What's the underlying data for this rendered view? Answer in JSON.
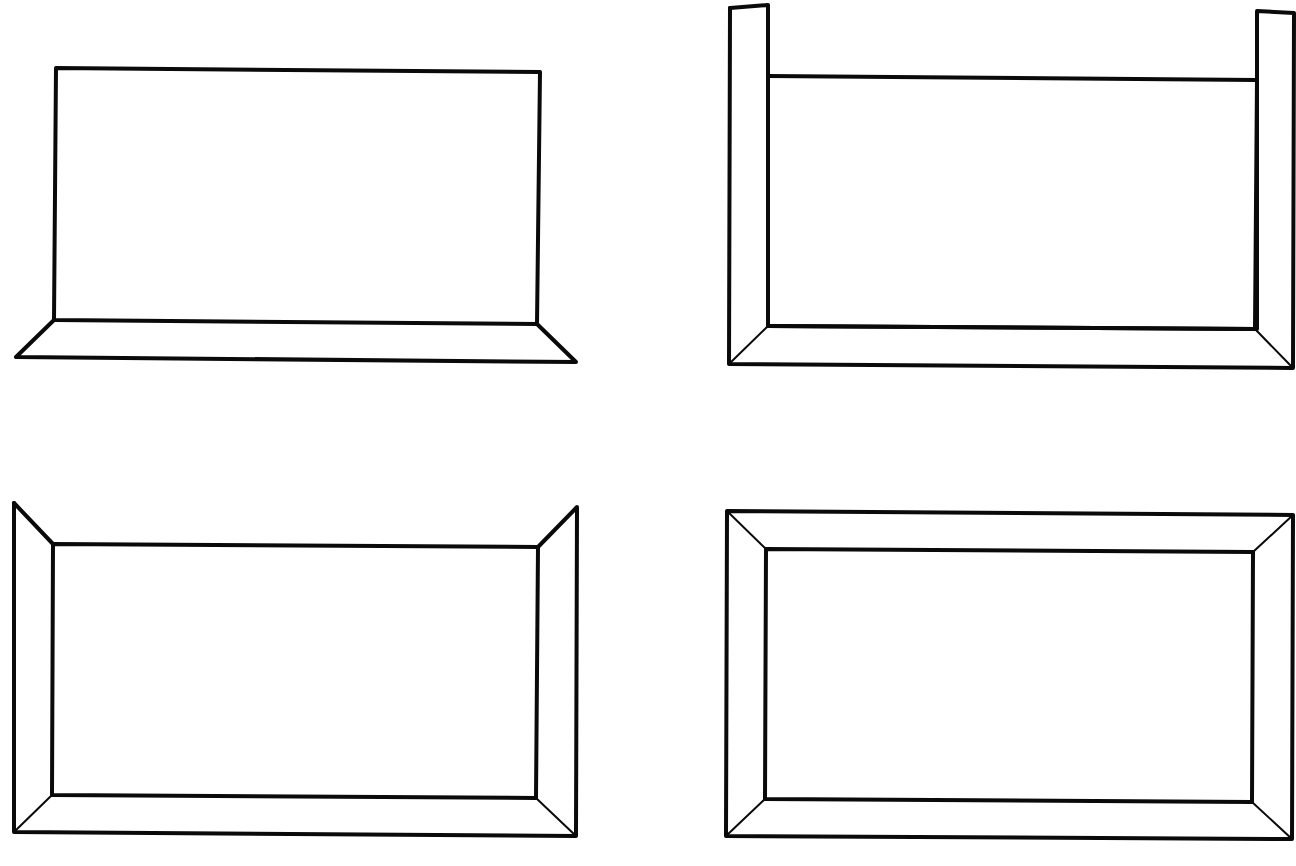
{
  "diagram": {
    "title": "",
    "stroke_color": "#0a0a0a",
    "background": "#ffffff",
    "panels": [
      {
        "id": "panel-1-bottom-trim",
        "description": "Rectangle with only the bottom molding strip flaring outward",
        "inner_rect": [
          [
            56,
            68
          ],
          [
            540,
            72
          ],
          [
            537,
            324
          ],
          [
            54,
            320
          ]
        ],
        "thick_paths": [
          [
            [
              56,
              68
            ],
            [
              540,
              72
            ],
            [
              537,
              324
            ],
            [
              54,
              320
            ],
            [
              56,
              68
            ]
          ],
          [
            [
              54,
              320
            ],
            [
              16,
              357
            ],
            [
              576,
              362
            ],
            [
              537,
              324
            ]
          ]
        ],
        "thin_paths": []
      },
      {
        "id": "panel-2-bottom-and-tall-sides",
        "description": "Rectangle with bottom molding and side strips extending above the top edge",
        "thick_paths": [
          [
            [
              768,
              76
            ],
            [
              1257,
              80
            ],
            [
              1255,
              329
            ],
            [
              768,
              326
            ]
          ],
          [
            [
              730,
              8
            ],
            [
              768,
              5
            ],
            [
              768,
              326
            ]
          ],
          [
            [
              730,
              8
            ],
            [
              729,
              364
            ],
            [
              1293,
              368
            ],
            [
              1294,
              13
            ],
            [
              1257,
              11
            ],
            [
              1257,
              329
            ]
          ],
          [
            [
              768,
              326
            ],
            [
              1255,
              329
            ]
          ]
        ],
        "thin_paths": [
          [
            [
              768,
              326
            ],
            [
              729,
              364
            ]
          ],
          [
            [
              1255,
              329
            ],
            [
              1293,
              368
            ]
          ]
        ]
      },
      {
        "id": "panel-3-sides-and-bottom",
        "description": "Rectangle with angled side strips and bottom molding, open top",
        "thick_paths": [
          [
            [
              53,
              544
            ],
            [
              538,
              547
            ],
            [
              536,
              798
            ],
            [
              52,
              795
            ],
            [
              53,
              544
            ]
          ],
          [
            [
              14,
              503
            ],
            [
              53,
              544
            ]
          ],
          [
            [
              14,
              503
            ],
            [
              14,
              832
            ],
            [
              576,
              836
            ],
            [
              577,
              507
            ],
            [
              538,
              547
            ]
          ]
        ],
        "thin_paths": [
          [
            [
              52,
              795
            ],
            [
              14,
              832
            ]
          ],
          [
            [
              536,
              798
            ],
            [
              576,
              836
            ]
          ]
        ]
      },
      {
        "id": "panel-4-full-frame",
        "description": "Rectangle fully framed by mitered molding on all four sides",
        "thick_paths": [
          [
            [
              766,
              549
            ],
            [
              1253,
              552
            ],
            [
              1252,
              802
            ],
            [
              765,
              799
            ],
            [
              766,
              549
            ]
          ],
          [
            [
              727,
              511
            ],
            [
              1293,
              515
            ],
            [
              1292,
              839
            ],
            [
              726,
              836
            ],
            [
              727,
              511
            ]
          ]
        ],
        "thin_paths": [
          [
            [
              727,
              511
            ],
            [
              766,
              549
            ]
          ],
          [
            [
              1293,
              515
            ],
            [
              1253,
              552
            ]
          ],
          [
            [
              726,
              836
            ],
            [
              765,
              799
            ]
          ],
          [
            [
              1292,
              839
            ],
            [
              1252,
              802
            ]
          ]
        ]
      }
    ]
  }
}
